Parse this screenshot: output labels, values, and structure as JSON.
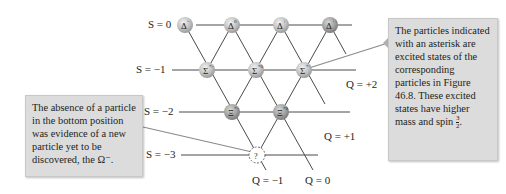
{
  "rows": [
    {
      "label": "S = 0"
    },
    {
      "label": "S = −1"
    },
    {
      "label": "S = −2"
    },
    {
      "label": "S = −3"
    }
  ],
  "charge_lines": [
    {
      "label": "Q = −1"
    },
    {
      "label": "Q = 0"
    },
    {
      "label": "Q = +1"
    },
    {
      "label": "Q = +2"
    }
  ],
  "particles": [
    {
      "symbol": "Δ",
      "sup": "−",
      "S": 0
    },
    {
      "symbol": "Δ",
      "sup": "0",
      "S": 0
    },
    {
      "symbol": "Δ",
      "sup": "+",
      "S": 0
    },
    {
      "symbol": "Δ",
      "sup": "++",
      "S": 0
    },
    {
      "symbol": "Σ",
      "sup": "*−",
      "S": -1
    },
    {
      "symbol": "Σ",
      "sup": "*0",
      "S": -1
    },
    {
      "symbol": "Σ",
      "sup": "*+",
      "S": -1
    },
    {
      "symbol": "Ξ",
      "sup": "*−",
      "S": -2
    },
    {
      "symbol": "Ξ",
      "sup": "*0",
      "S": -2
    },
    {
      "symbol": "?",
      "sup": "",
      "S": -3
    }
  ],
  "callouts": {
    "left": {
      "text": "The absence of a particle in the bottom position was evidence of a new particle yet to be discovered, the Ω⁻."
    },
    "right": {
      "text": "The particles indicated with an asterisk are excited states of the corresponding particles in Figure 46.8. These excited states have higher mass and spin ",
      "fraction_num": "3",
      "fraction_den": "2",
      "end": "."
    }
  },
  "colors": {
    "node_fill": "#c4c4c4",
    "line": "#4a4a4a",
    "callout_bg": "#dcdcdc",
    "text": "#231f20"
  }
}
